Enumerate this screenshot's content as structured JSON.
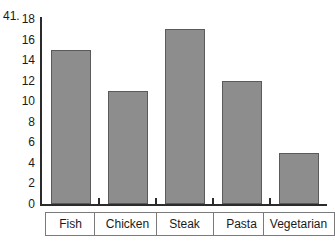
{
  "figure": {
    "number_label": "41."
  },
  "chart_data": {
    "type": "bar",
    "title": "",
    "xlabel": "",
    "ylabel": "",
    "categories": [
      "Fish",
      "Chicken",
      "Steak",
      "Pasta",
      "Vegetarian"
    ],
    "values": [
      15,
      11,
      17,
      12,
      5
    ],
    "ylim": [
      0,
      18
    ],
    "y_ticks": [
      18,
      16,
      14,
      12,
      10,
      8,
      6,
      4,
      2,
      0
    ],
    "y_tick_labels": [
      "18",
      "16",
      "14",
      "12",
      "10",
      "8",
      "6",
      "4",
      "2",
      "0"
    ],
    "grid": false,
    "legend": false,
    "bar_color": "#8d8d8d",
    "bar_border_color": "#5a5a5a",
    "axis_color": "#2b2b2b",
    "background_color": "#ffffff"
  }
}
